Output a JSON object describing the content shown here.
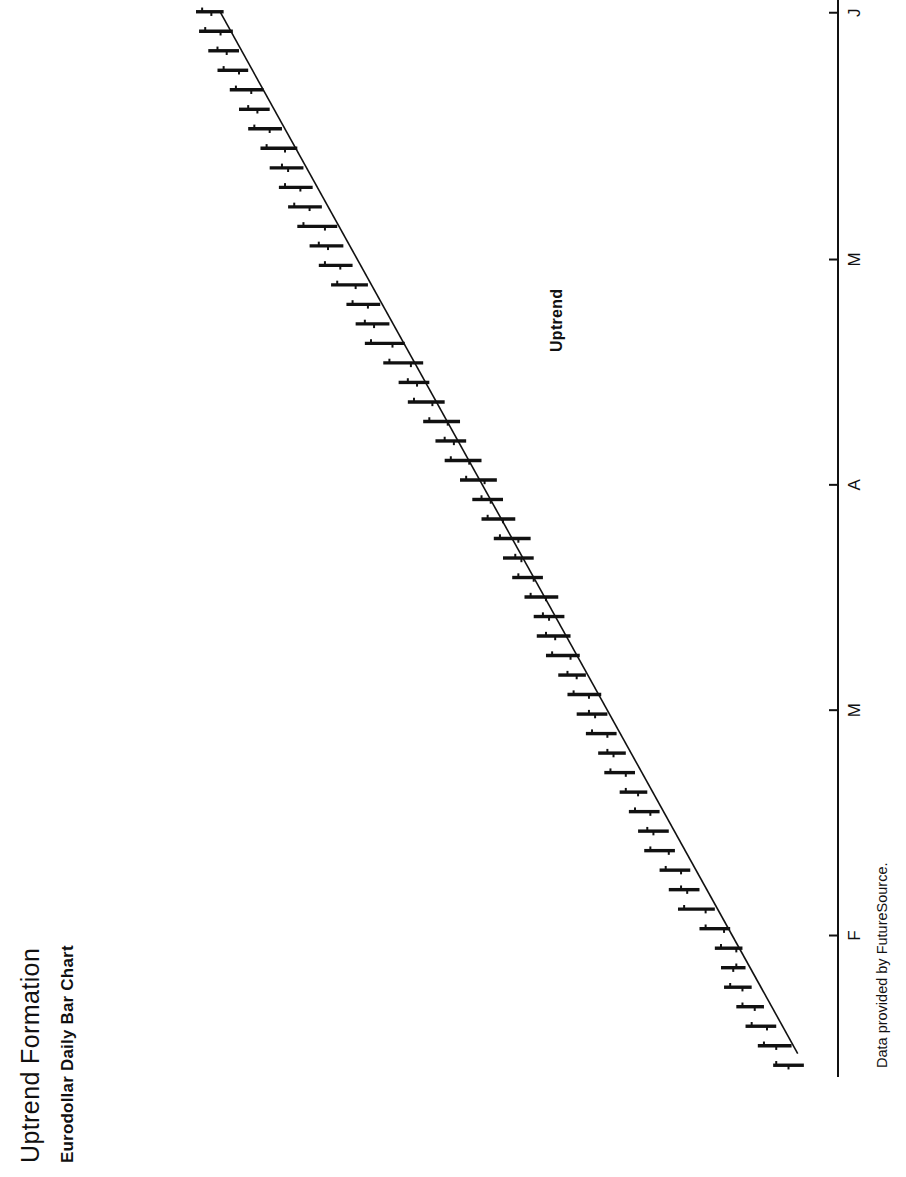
{
  "document": {
    "title": "Uptrend Formation",
    "subtitle": "Eurodollar Daily Bar Chart",
    "source_note": "Data provided by FutureSource.",
    "orientation": "landscape-rotated-90-ccw",
    "background_color": "#ffffff",
    "ink_color": "#111111"
  },
  "annotations": {
    "trendline_label": "Uptrend"
  },
  "chart_data": {
    "type": "bar",
    "subtype": "ohlc-price-bars",
    "title": "Uptrend Formation",
    "subtitle": "Eurodollar Daily Bar Chart",
    "xlabel": "",
    "ylabel": "",
    "grid": false,
    "legend": "none",
    "orientation": "rotated 90 degrees counter-clockwise; time axis runs bottom-to-top along the right edge, price increases to the left",
    "axis": {
      "name": "time-axis",
      "tick_labels": [
        "F",
        "M",
        "A",
        "M",
        "J"
      ],
      "tick_label_meanings": [
        "February",
        "March",
        "April",
        "May",
        "June"
      ],
      "tick_positions_fraction": [
        0.13,
        0.34,
        0.55,
        0.76,
        0.99
      ],
      "line_visible": true,
      "range_description": "late January through early June"
    },
    "annotations": [
      {
        "text": "Uptrend",
        "type": "trendline",
        "description": "Straight ascending support line drawn beneath the rising sequence of daily lows, from the late-January low to the late-May test.",
        "start_fraction": [
          0.02,
          0.04
        ],
        "end_fraction": [
          0.99,
          0.92
        ]
      }
    ],
    "series": [
      {
        "name": "Eurodollar daily price bars",
        "description": "Each bar shows the daily high-low range with a left tick for the open and a right tick for the close. Values below are normalized price units where 0 is the lowest low on the chart and 100 is the highest high.",
        "fields": [
          "open",
          "high",
          "low",
          "close"
        ],
        "values": [
          [
            3.5,
            6.0,
            1.0,
            5.5
          ],
          [
            5.5,
            8.5,
            3.0,
            7.5
          ],
          [
            7.0,
            10.5,
            5.5,
            9.5
          ],
          [
            9.0,
            12.0,
            7.5,
            11.0
          ],
          [
            11.0,
            14.0,
            9.5,
            13.0
          ],
          [
            12.5,
            14.5,
            10.5,
            12.0
          ],
          [
            12.0,
            15.5,
            11.0,
            14.5
          ],
          [
            14.0,
            18.0,
            13.0,
            17.0
          ],
          [
            17.0,
            21.5,
            15.5,
            20.5
          ],
          [
            20.0,
            23.0,
            18.0,
            21.0
          ],
          [
            21.0,
            24.5,
            19.5,
            23.5
          ],
          [
            23.0,
            27.0,
            22.0,
            26.0
          ],
          [
            25.5,
            28.0,
            23.0,
            26.5
          ],
          [
            26.0,
            29.5,
            24.5,
            28.5
          ],
          [
            28.0,
            31.0,
            26.5,
            30.0
          ],
          [
            30.0,
            33.5,
            28.5,
            32.5
          ],
          [
            32.0,
            34.5,
            30.0,
            33.0
          ],
          [
            33.0,
            36.5,
            31.5,
            35.5
          ],
          [
            35.0,
            38.0,
            33.0,
            36.0
          ],
          [
            36.0,
            39.5,
            34.0,
            38.5
          ],
          [
            38.0,
            41.0,
            36.5,
            39.5
          ],
          [
            39.0,
            43.0,
            37.5,
            42.0
          ],
          [
            41.5,
            44.5,
            39.0,
            43.0
          ],
          [
            42.5,
            45.0,
            40.0,
            43.5
          ],
          [
            43.0,
            46.5,
            41.0,
            45.5
          ],
          [
            45.0,
            48.5,
            43.5,
            47.5
          ],
          [
            47.0,
            50.0,
            45.0,
            48.0
          ],
          [
            47.5,
            51.5,
            45.5,
            50.5
          ],
          [
            50.0,
            53.5,
            48.0,
            52.5
          ],
          [
            52.0,
            55.0,
            50.0,
            53.5
          ],
          [
            53.0,
            57.0,
            51.0,
            56.0
          ],
          [
            55.5,
            59.5,
            53.5,
            58.5
          ],
          [
            58.0,
            61.0,
            56.0,
            59.5
          ],
          [
            59.0,
            63.0,
            57.0,
            62.0
          ],
          [
            61.5,
            65.5,
            59.5,
            64.5
          ],
          [
            64.0,
            67.0,
            62.0,
            65.5
          ],
          [
            65.0,
            69.5,
            63.0,
            68.5
          ],
          [
            68.0,
            72.5,
            66.0,
            71.5
          ],
          [
            71.0,
            74.0,
            68.5,
            72.5
          ],
          [
            72.0,
            75.5,
            70.0,
            74.5
          ],
          [
            74.0,
            78.0,
            72.0,
            77.0
          ],
          [
            76.5,
            80.0,
            74.5,
            79.0
          ],
          [
            78.5,
            81.5,
            76.0,
            80.0
          ],
          [
            79.0,
            83.5,
            77.0,
            82.5
          ],
          [
            81.5,
            85.0,
            79.5,
            84.0
          ],
          [
            83.0,
            86.5,
            81.0,
            85.5
          ],
          [
            85.0,
            88.0,
            82.5,
            86.0
          ],
          [
            85.5,
            89.5,
            83.5,
            88.5
          ],
          [
            88.0,
            91.5,
            86.0,
            90.5
          ],
          [
            90.0,
            93.0,
            88.0,
            91.5
          ],
          [
            91.0,
            94.5,
            89.0,
            93.5
          ],
          [
            93.0,
            96.5,
            91.5,
            95.5
          ],
          [
            95.0,
            98.0,
            93.0,
            96.5
          ],
          [
            96.0,
            99.5,
            94.0,
            98.5
          ],
          [
            97.5,
            100.0,
            95.5,
            99.0
          ]
        ]
      }
    ]
  }
}
